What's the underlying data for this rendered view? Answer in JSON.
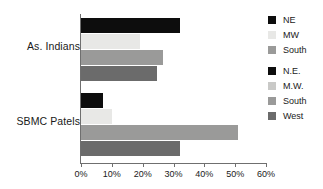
{
  "chart_data": {
    "type": "bar",
    "orientation": "horizontal",
    "title": "",
    "xlabel": "",
    "ylabel": "",
    "categories": [
      "As. Indians",
      "SBMC Patels"
    ],
    "series": [
      {
        "name": "NE",
        "color": "#0d0d0d",
        "values": [
          32.0,
          7.0
        ]
      },
      {
        "name": "MW",
        "color": "#e8e8e6",
        "values": [
          19.0,
          10.0
        ]
      },
      {
        "name": "South",
        "color": "#9a9a99",
        "values": [
          26.5,
          51.0
        ]
      },
      {
        "name": "West",
        "color": "#6b6b6b",
        "values": [
          24.5,
          32.0
        ]
      }
    ],
    "xlim": [
      0,
      60
    ],
    "xticks": [
      0,
      10,
      20,
      30,
      40,
      50,
      60
    ],
    "xtick_labels": [
      "0%",
      "10%",
      "20%",
      "30%",
      "40%",
      "50%",
      "60%"
    ],
    "grid": false,
    "legend_position": "right"
  },
  "legend": {
    "groups": [
      {
        "items": [
          {
            "label": "NE",
            "color": "#0d0d0d"
          },
          {
            "label": "MW",
            "color": "#e8e8e6"
          },
          {
            "label": "South",
            "color": "#9a9a99"
          }
        ]
      },
      {
        "items": [
          {
            "label": "N.E.",
            "color": "#0d0d0d"
          },
          {
            "label": "M.W.",
            "color": "#c9c9c7"
          },
          {
            "label": "South",
            "color": "#9a9a99"
          },
          {
            "label": "West",
            "color": "#6b6b6b"
          }
        ]
      }
    ]
  }
}
